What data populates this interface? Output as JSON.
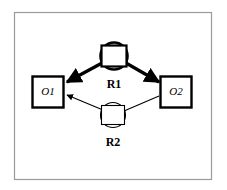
{
  "figure": {
    "kind": "entity-relationship-diagram",
    "border_color": "#9a9a9a",
    "stroke_color": "#000000",
    "fill_color": "#ffffff",
    "background_color": "#ffffff"
  },
  "objects": [
    {
      "id": "o1",
      "label": "O1",
      "shape": "square",
      "x": 32,
      "y": 76,
      "size": 32
    },
    {
      "id": "o2",
      "label": "O2",
      "shape": "square",
      "x": 160,
      "y": 76,
      "size": 32
    }
  ],
  "relationships": [
    {
      "id": "r1",
      "label": "R1",
      "shape": "circle-with-inscribed-square",
      "cx": 114,
      "cy": 56,
      "r": 14,
      "emphasis": "bold"
    },
    {
      "id": "r2",
      "label": "R2",
      "shape": "circle-with-inscribed-square",
      "cx": 113,
      "cy": 115,
      "r": 13,
      "emphasis": "thin"
    }
  ],
  "edges": [
    {
      "id": "r1-to-o1",
      "from": "r1",
      "to": "o1",
      "arrowhead": "target",
      "weight": "bold"
    },
    {
      "id": "r1-to-o2",
      "from": "r1",
      "to": "o2",
      "arrowhead": "target",
      "weight": "bold"
    },
    {
      "id": "r2-to-o1",
      "from": "r2",
      "to": "o1",
      "arrowhead": "target",
      "weight": "thin"
    },
    {
      "id": "o2-to-r2",
      "from": "o2",
      "to": "r2",
      "arrowhead": "none",
      "weight": "thin"
    }
  ]
}
